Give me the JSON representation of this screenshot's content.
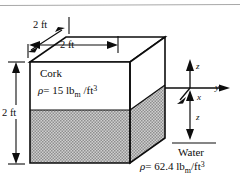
{
  "figure": {
    "dimensions": {
      "depth_top": "2 ft",
      "width_front": "2 ft",
      "height_left": "2 ft"
    },
    "materials": {
      "upper": {
        "name": "Cork",
        "density_symbol": "ρ",
        "density_equals": "=",
        "density_value": "15",
        "density_unit_main": "lb",
        "density_unit_sub": "m",
        "density_unit_per": "/ft",
        "density_unit_exp": "3"
      },
      "lower": {
        "name": "Water",
        "density_symbol": "ρ",
        "density_equals": "=",
        "density_value": "62.4",
        "density_unit_main": "lb",
        "density_unit_sub": "m",
        "density_unit_per": "/ft",
        "density_unit_exp": "3"
      }
    },
    "axes": {
      "z_up": "z",
      "y_right": "y",
      "x_front": "x",
      "z_down": "z"
    },
    "colors": {
      "outline": "#0d0d0d",
      "water_fill": "#b3b3b3",
      "cork_fill": "#ffffff",
      "top_fill": "#ffffff",
      "rule": "#a8a8a8",
      "background": "#ffffff"
    }
  }
}
